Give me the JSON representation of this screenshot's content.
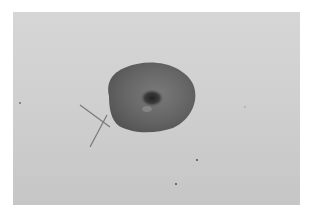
{
  "image": {
    "description": "Grayscale photograph of a dark oval object with a central dimple on a light gray background, with two crossed thin lines at its lower-left edge",
    "colors": {
      "background_top": "#d6d6d6",
      "background_bottom": "#c6c6c6",
      "object_fill": "#6a6a6a",
      "object_edge": "#555555",
      "center_dimple": "#2e2e2e",
      "cross_lines": "#7a7a7a",
      "specks": "#555555"
    }
  }
}
